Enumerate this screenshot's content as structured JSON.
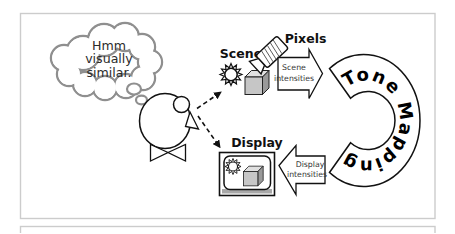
{
  "diagram": {
    "thought": {
      "line1": "Hmm",
      "line2": "visually",
      "line3": "similar."
    },
    "scene": {
      "label": "Scene"
    },
    "pixels": {
      "label": "Pixels"
    },
    "display": {
      "label": "Display"
    },
    "scene_arrow": {
      "line1": "Scene",
      "line2": "intensities"
    },
    "display_arrow": {
      "line1": "Display",
      "line2": "intensities"
    },
    "tone_mapping": {
      "label": "Tone Mapping"
    },
    "icons": {
      "scene_sun": "sun-icon",
      "scene_cube": "cube-icon",
      "camera": "camera-icon",
      "display_monitor": "display-monitor-icon",
      "display_sun": "sun-icon",
      "display_cube": "cube-icon",
      "thought": "thought-bubble",
      "person": "person-figure"
    },
    "colors": {
      "background": "#ffffff",
      "frame_border": "#cccccc",
      "ink": "#111111",
      "bubble_outline": "#8f8f8f",
      "cube_front": "#c6c6c6",
      "cube_top": "#e0e0e0",
      "cube_side": "#999999",
      "monitor_band": "#a8a8a8"
    }
  }
}
